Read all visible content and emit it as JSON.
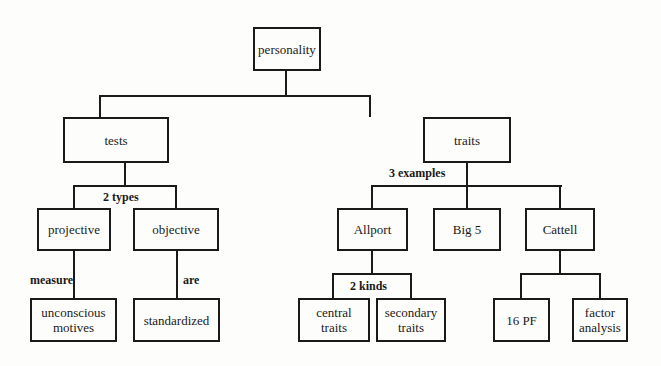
{
  "diagram": {
    "type": "hierarchy-concept-map",
    "root": "personality",
    "nodes": {
      "personality": "personality",
      "tests": "tests",
      "traits": "traits",
      "projective": "projective",
      "objective": "objective",
      "unconscious_motives": "unconscious motives",
      "standardized": "standardized",
      "allport": "Allport",
      "big5": "Big 5",
      "cattell": "Cattell",
      "central_traits": "central traits",
      "secondary_traits": "secondary traits",
      "pf16": "16 PF",
      "factor_analysis": "factor analysis"
    },
    "edge_labels": {
      "tests_types": "2 types",
      "traits_examples": "3 examples",
      "projective_measure": "measure",
      "objective_are": "are",
      "allport_kinds": "2 kinds"
    },
    "edges": [
      [
        "personality",
        "tests",
        ""
      ],
      [
        "personality",
        "traits",
        ""
      ],
      [
        "tests",
        "projective",
        "2 types"
      ],
      [
        "tests",
        "objective",
        "2 types"
      ],
      [
        "projective",
        "unconscious motives",
        "measure"
      ],
      [
        "objective",
        "standardized",
        "are"
      ],
      [
        "traits",
        "Allport",
        "3 examples"
      ],
      [
        "traits",
        "Big 5",
        "3 examples"
      ],
      [
        "traits",
        "Cattell",
        "3 examples"
      ],
      [
        "Allport",
        "central traits",
        "2 kinds"
      ],
      [
        "Allport",
        "secondary traits",
        "2 kinds"
      ],
      [
        "Cattell",
        "16 PF",
        ""
      ],
      [
        "Cattell",
        "factor analysis",
        ""
      ]
    ]
  }
}
